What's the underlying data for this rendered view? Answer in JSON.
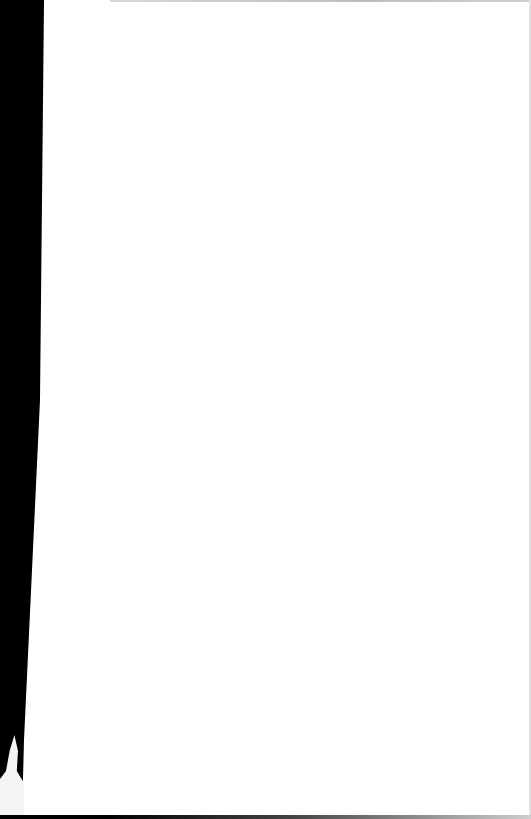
{
  "document": {
    "type": "scanned-page",
    "content": "",
    "colors": {
      "page": "#ffffff",
      "margin": "#000000",
      "edge": "#c8c8c8"
    }
  }
}
